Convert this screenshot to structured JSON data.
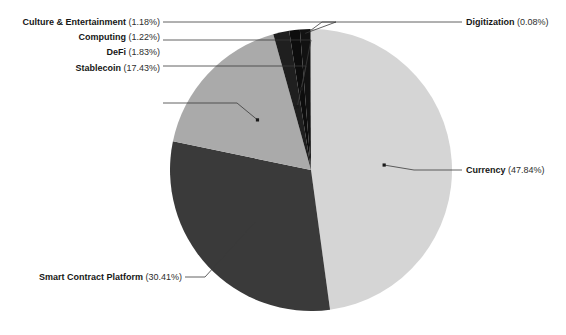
{
  "chart_data": {
    "type": "pie",
    "title": "",
    "subtitle": "",
    "xlabel": "",
    "ylabel": "",
    "legend_position": "none",
    "grid": false,
    "start_angle_deg": 0,
    "direction": "clockwise",
    "units": "percent",
    "categories": [
      "Currency",
      "Smart Contract Platform",
      "Stablecoin",
      "DeFi",
      "Computing",
      "Culture & Entertainment",
      "Digitization"
    ],
    "values": [
      47.84,
      30.41,
      17.43,
      1.83,
      1.22,
      1.18,
      0.08
    ],
    "colors": [
      "#d5d5d5",
      "#3a3a3a",
      "#aaaaaa",
      "#1f1f1f",
      "#0d0d0d",
      "#121212",
      "#565656"
    ],
    "slices": [
      {
        "label": "Currency",
        "value": 47.84,
        "value_text": "(47.84%)",
        "color": "#d5d5d5",
        "label_side": "right"
      },
      {
        "label": "Smart Contract Platform",
        "value": 30.41,
        "value_text": "(30.41%)",
        "color": "#3a3a3a",
        "label_side": "left"
      },
      {
        "label": "Stablecoin",
        "value": 17.43,
        "value_text": "(17.43%)",
        "color": "#aaaaaa",
        "label_side": "left"
      },
      {
        "label": "DeFi",
        "value": 1.83,
        "value_text": "(1.83%)",
        "color": "#1f1f1f",
        "label_side": "left"
      },
      {
        "label": "Computing",
        "value": 1.22,
        "value_text": "(1.22%)",
        "color": "#0d0d0d",
        "label_side": "left"
      },
      {
        "label": "Culture & Entertainment",
        "value": 1.18,
        "value_text": "(1.18%)",
        "color": "#121212",
        "label_side": "left"
      },
      {
        "label": "Digitization",
        "value": 0.08,
        "value_text": "(0.08%)",
        "color": "#565656",
        "label_side": "right"
      }
    ]
  },
  "figure": {
    "background_color": "#ffffff",
    "text_color": "#1b1b1b",
    "leader_line_color": "#3a3a3a",
    "center_x": 311,
    "center_y": 170,
    "radius": 141
  },
  "labels": {
    "culture": {
      "name": "Culture & Entertainment",
      "pct": "(1.18%)"
    },
    "computing": {
      "name": "Computing",
      "pct": "(1.22%)"
    },
    "defi": {
      "name": "DeFi",
      "pct": "(1.83%)"
    },
    "stablecoin": {
      "name": "Stablecoin",
      "pct": "(17.43%)"
    },
    "digitization": {
      "name": "Digitization",
      "pct": "(0.08%)"
    },
    "currency": {
      "name": "Currency",
      "pct": "(47.84%)"
    },
    "smart_contract": {
      "name": "Smart Contract Platform",
      "pct": "(30.41%)"
    }
  }
}
